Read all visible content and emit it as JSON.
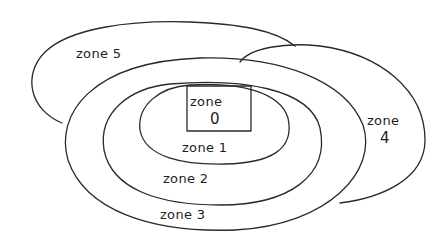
{
  "diagram": {
    "title": "",
    "zones": [
      {
        "id": "zone-0",
        "label_line1": "zone",
        "label_line2": "0"
      },
      {
        "id": "zone-1",
        "label": "zone 1"
      },
      {
        "id": "zone-2",
        "label": "zone 2"
      },
      {
        "id": "zone-3",
        "label": "zone 3"
      },
      {
        "id": "zone-4",
        "label_line1": "zone",
        "label_line2": "4"
      },
      {
        "id": "zone-5",
        "label": "zone 5"
      }
    ],
    "colors": {
      "stroke": "#2a2a2a",
      "text": "#1e1e1e",
      "background": "#ffffff"
    }
  }
}
